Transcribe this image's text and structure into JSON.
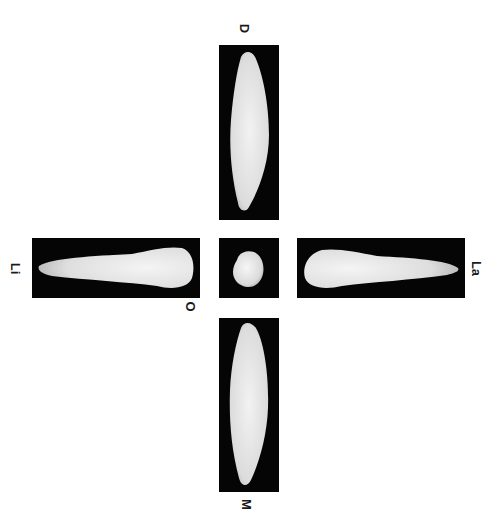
{
  "figure": {
    "background_color": "#ffffff",
    "panel_color": "#050505",
    "tooth_color": "#e6e6e6",
    "views": [
      {
        "id": "distal",
        "label": "D",
        "position": "top"
      },
      {
        "id": "lingual",
        "label": "Li",
        "position": "left"
      },
      {
        "id": "occlusal",
        "label": "O",
        "position": "center"
      },
      {
        "id": "labial",
        "label": "La",
        "position": "right"
      },
      {
        "id": "mesial",
        "label": "M",
        "position": "bottom"
      }
    ]
  }
}
